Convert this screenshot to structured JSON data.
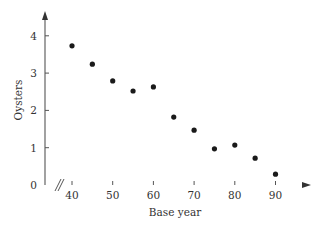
{
  "chart_data": {
    "type": "scatter",
    "title": "",
    "xlabel": "Base year",
    "ylabel": "Oysters",
    "x": [
      40,
      45,
      50,
      55,
      60,
      65,
      70,
      75,
      80,
      85,
      90
    ],
    "y": [
      3.73,
      3.24,
      2.79,
      2.52,
      2.63,
      1.82,
      1.47,
      0.97,
      1.07,
      0.72,
      0.29
    ],
    "xticks": [
      40,
      50,
      60,
      70,
      80,
      90
    ],
    "yticks": [
      0,
      1,
      2,
      3,
      4
    ],
    "xlim": [
      32,
      97
    ],
    "ylim": [
      0,
      4.8
    ],
    "x_axis_break": true,
    "grid": false,
    "legend": null
  },
  "colors": {
    "axis": "#555555",
    "points": "#1a1a1a",
    "text": "#333333"
  }
}
